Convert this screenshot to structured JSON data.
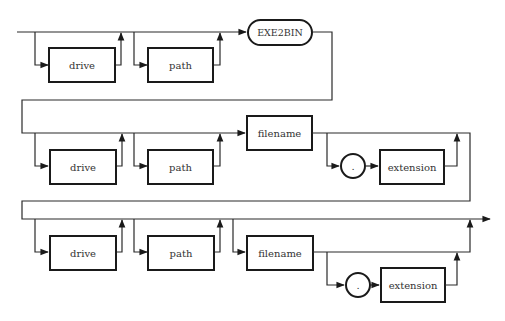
{
  "diagram": {
    "type": "syntax-railroad",
    "command": "EXE2BIN",
    "rows": [
      {
        "row": 1,
        "elements": [
          {
            "label": "drive",
            "optional": true
          },
          {
            "label": "path",
            "optional": true
          },
          {
            "label": "EXE2BIN",
            "kind": "keyword"
          }
        ]
      },
      {
        "row": 2,
        "elements": [
          {
            "label": "drive",
            "optional": true
          },
          {
            "label": "path",
            "optional": true
          },
          {
            "label": "filename"
          },
          {
            "label": ".",
            "kind": "terminal",
            "optional": true
          },
          {
            "label": "extension",
            "optional": true
          }
        ]
      },
      {
        "row": 3,
        "elements": [
          {
            "label": "drive",
            "optional": true
          },
          {
            "label": "path",
            "optional": true
          },
          {
            "label": "filename",
            "optional": true
          },
          {
            "label": ".",
            "kind": "terminal",
            "optional": true
          },
          {
            "label": "extension",
            "optional": true
          }
        ]
      }
    ]
  },
  "labels": {
    "r1_drive": "drive",
    "r1_path": "path",
    "r1_cmd": "EXE2BIN",
    "r2_drive": "drive",
    "r2_path": "path",
    "r2_filename": "filename",
    "r2_dot": ".",
    "r2_extension": "extension",
    "r3_drive": "drive",
    "r3_path": "path",
    "r3_filename": "filename",
    "r3_dot": ".",
    "r3_extension": "extension"
  },
  "colors": {
    "line": "#2a2a2a",
    "box_border": "#1a1a1a",
    "background": "#ffffff"
  }
}
